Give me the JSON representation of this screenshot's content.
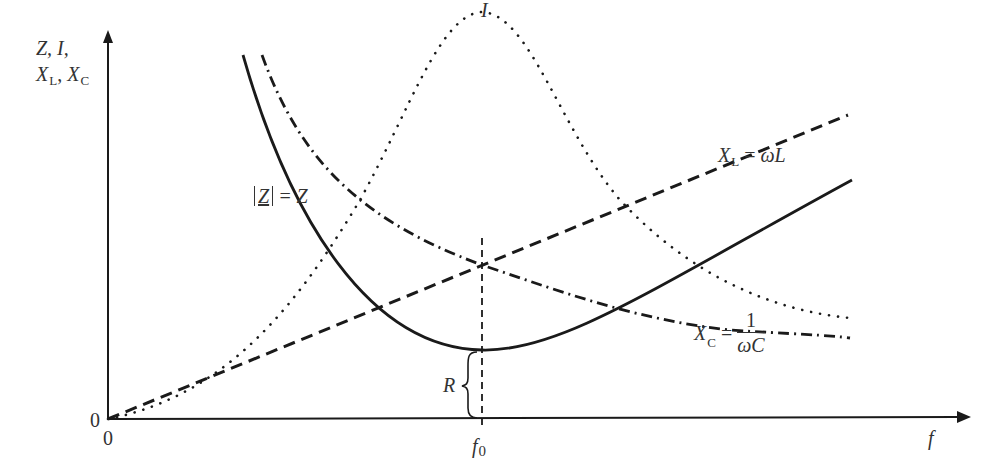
{
  "diagram": {
    "y_axis": {
      "label_line1": "Z, I,",
      "label_line2_a": "X",
      "label_line2_a_sub": "L",
      "label_line2_sep": ", ",
      "label_line2_b": "X",
      "label_line2_b_sub": "C",
      "origin_label": "0"
    },
    "x_axis": {
      "label": "f",
      "origin_label": "0",
      "resonance_label": "f",
      "resonance_sub": "0"
    },
    "curves": {
      "current": {
        "label": "I",
        "style": "dotted"
      },
      "inductive_reactance": {
        "label_var": "X",
        "label_sub": "L",
        "label_eq": " = ",
        "label_expr": "ωL",
        "style": "dashed"
      },
      "capacitive_reactance": {
        "label_var": "X",
        "label_sub": "C",
        "label_eq": " = ",
        "label_num": "1",
        "label_den": "ωC",
        "style": "dash-dot"
      },
      "impedance": {
        "label_abs": "Z",
        "label_eq": " = Z",
        "style": "solid"
      }
    },
    "annotations": {
      "resistance": "R"
    },
    "colors": {
      "stroke": "#1a1a1a",
      "text": "#333333",
      "background": "#ffffff"
    }
  }
}
